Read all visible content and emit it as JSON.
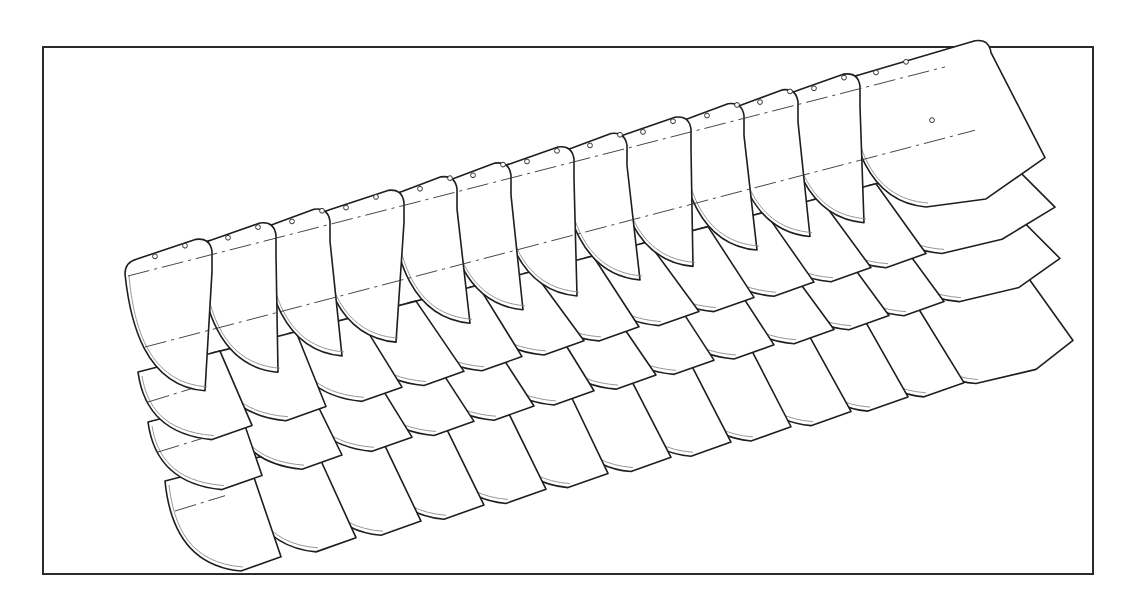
{
  "figure": {
    "frame": {
      "x": 42,
      "y": 46,
      "width": 1052,
      "height": 529
    },
    "slope": -0.255,
    "tile_width": 80,
    "rows": [
      {
        "name": "row-1-top",
        "tile_height": 120,
        "curve_depth": 44,
        "has_holes": true,
        "tiles_x": [
          125,
          198,
          262,
          316,
          390,
          443,
          497,
          560,
          613,
          677,
          730,
          784,
          846
        ],
        "start_y": 262,
        "end_x": 985
      },
      {
        "name": "row-2",
        "tile_height": 60,
        "curve_depth": 38,
        "has_holes": false,
        "tiles_x": [
          138,
          212,
          288,
          350,
          408,
          470,
          525,
          585,
          640,
          700,
          757,
          812,
          868
        ],
        "start_y": 372,
        "end_x": 1000
      },
      {
        "name": "row-3",
        "tile_height": 60,
        "curve_depth": 38,
        "has_holes": false,
        "tiles_x": [
          148,
          228,
          298,
          360,
          420,
          480,
          542,
          600,
          660,
          720,
          775,
          830,
          885
        ],
        "start_y": 422,
        "end_x": 1005
      },
      {
        "name": "row-4-bottom",
        "tile_height": 82,
        "curve_depth": 40,
        "has_holes": false,
        "tiles_x": [
          165,
          240,
          305,
          368,
          430,
          492,
          555,
          615,
          675,
          735,
          792,
          848,
          900
        ],
        "start_y": 481,
        "end_x": 1018
      }
    ],
    "labels": []
  }
}
